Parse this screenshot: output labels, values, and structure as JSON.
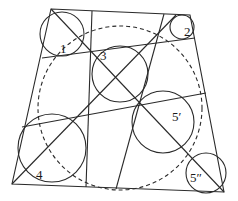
{
  "diagram": {
    "type": "geometric-construction",
    "quadrilateral": [
      [
        51,
        9
      ],
      [
        190,
        15
      ],
      [
        224,
        192
      ],
      [
        12,
        184
      ]
    ],
    "lines": [
      {
        "name": "upper-transversal",
        "from": [
          42,
          58
        ],
        "to": [
          195,
          38
        ]
      },
      {
        "name": "lower-transversal",
        "from": [
          22,
          127
        ],
        "to": [
          206,
          93
        ]
      },
      {
        "name": "left-vertical",
        "from": [
          92,
          11
        ],
        "to": [
          86,
          187
        ]
      },
      {
        "name": "right-slant",
        "from": [
          164,
          14
        ],
        "to": [
          116,
          189
        ]
      },
      {
        "name": "main-diagonal",
        "from": [
          51,
          9
        ],
        "to": [
          224,
          192
        ]
      },
      {
        "name": "anti-diagonal",
        "from": [
          12,
          184
        ],
        "to": [
          176,
          15
        ]
      }
    ],
    "circles": [
      {
        "id": "1",
        "cx": 62,
        "cy": 34,
        "r": 22,
        "label": "1",
        "lx": 60,
        "ly": 53
      },
      {
        "id": "2",
        "cx": 182,
        "cy": 27,
        "r": 12,
        "label": "2",
        "lx": 184,
        "ly": 36
      },
      {
        "id": "3",
        "cx": 120,
        "cy": 74,
        "r": 28,
        "label": "3",
        "lx": 100,
        "ly": 60
      },
      {
        "id": "4",
        "cx": 52,
        "cy": 148,
        "r": 34,
        "label": "4",
        "lx": 36,
        "ly": 179
      },
      {
        "id": "5p",
        "cx": 163,
        "cy": 122,
        "r": 31,
        "label": "5′",
        "lx": 172,
        "ly": 121
      },
      {
        "id": "5pp",
        "cx": 206,
        "cy": 173,
        "r": 20,
        "label": "5″",
        "lx": 190,
        "ly": 182
      }
    ],
    "dashed_circle": {
      "cx": 120,
      "cy": 108,
      "r": 82
    }
  }
}
